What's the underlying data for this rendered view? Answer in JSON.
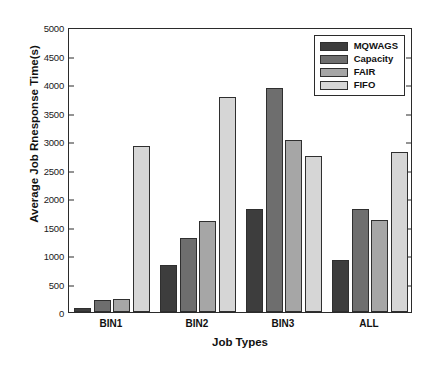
{
  "chart_data": {
    "type": "bar",
    "title": "",
    "xlabel": "Job Types",
    "ylabel": "Average Job Rnesponse Time(s)",
    "categories": [
      "BIN1",
      "BIN2",
      "BIN3",
      "ALL"
    ],
    "series": [
      {
        "name": "MQWAGS",
        "color": "#3d3d3d",
        "values": [
          70,
          830,
          1800,
          910
        ]
      },
      {
        "name": "Capacity",
        "color": "#6e6e6e",
        "values": [
          205,
          1290,
          3930,
          1810
        ]
      },
      {
        "name": "FAIR",
        "color": "#a6a6a6",
        "values": [
          225,
          1590,
          3010,
          1610
        ]
      },
      {
        "name": "FIFO",
        "color": "#d6d6d6",
        "values": [
          2905,
          3780,
          2730,
          2810
        ]
      }
    ],
    "ylim": [
      0,
      5000
    ],
    "yticks": [
      0,
      500,
      1000,
      1500,
      2000,
      2500,
      3000,
      3500,
      4000,
      4500,
      5000
    ],
    "ytick_labels": [
      "0",
      "500",
      "1000",
      "1500",
      "2000",
      "2500",
      "3000",
      "3500",
      "4000",
      "4500",
      "5000"
    ],
    "grid": false,
    "legend_position": "top-right",
    "legend_entries": [
      "MQWAGS",
      "Capacity",
      "FAIR",
      "FIFO"
    ],
    "axis_color": "#2b2b2b",
    "background_color": "#ffffff"
  }
}
